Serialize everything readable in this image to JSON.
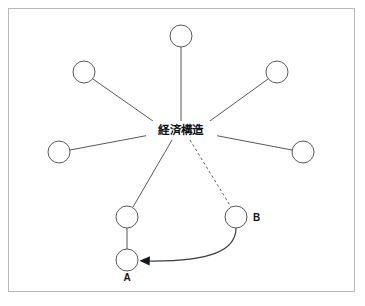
{
  "diagram": {
    "title_text": "経済構造",
    "frame": {
      "border_color": "#b9b9b9",
      "background": "#ffffff"
    },
    "colors": {
      "node_stroke": "#555a5f",
      "node_fill": "#ffffff",
      "edge": "#55595e",
      "arrow": "#17191c",
      "text": "#101316"
    },
    "center": {
      "x": 181,
      "y": 130,
      "label": "経済構造"
    },
    "nodes": [
      {
        "id": "n-top",
        "label": "",
        "cx": 181,
        "cy": 36,
        "r": 11
      },
      {
        "id": "n-upper-left",
        "label": "",
        "cx": 84,
        "cy": 72,
        "r": 11
      },
      {
        "id": "n-upper-right",
        "label": "",
        "cx": 277,
        "cy": 72,
        "r": 11
      },
      {
        "id": "n-left",
        "label": "",
        "cx": 59,
        "cy": 152,
        "r": 11
      },
      {
        "id": "n-right",
        "label": "",
        "cx": 303,
        "cy": 152,
        "r": 11
      },
      {
        "id": "n-mid-lower",
        "label": "",
        "cx": 127,
        "cy": 217,
        "r": 11
      },
      {
        "id": "n-a",
        "label": "A",
        "cx": 127,
        "cy": 260,
        "r": 11
      },
      {
        "id": "n-b",
        "label": "B",
        "cx": 236,
        "cy": 217,
        "r": 11
      }
    ],
    "labels": [
      {
        "id": "label-a",
        "text": "A",
        "x": 127,
        "y": 281
      },
      {
        "id": "label-b",
        "text": "B",
        "x": 253,
        "y": 221
      }
    ],
    "edges": [
      {
        "id": "edge-center-top",
        "from": "center",
        "to": "n-top",
        "style": "solid"
      },
      {
        "id": "edge-center-upper-left",
        "from": "center",
        "to": "n-upper-left",
        "style": "solid"
      },
      {
        "id": "edge-center-upper-right",
        "from": "center",
        "to": "n-upper-right",
        "style": "solid"
      },
      {
        "id": "edge-center-left",
        "from": "center",
        "to": "n-left",
        "style": "solid"
      },
      {
        "id": "edge-center-right",
        "from": "center",
        "to": "n-right",
        "style": "solid"
      },
      {
        "id": "edge-center-mid-lower",
        "from": "center",
        "to": "n-mid-lower",
        "style": "solid"
      },
      {
        "id": "edge-center-b",
        "from": "center",
        "to": "n-b",
        "style": "dashed"
      },
      {
        "id": "edge-mid-lower-a",
        "from": "n-mid-lower",
        "to": "n-a",
        "style": "solid"
      },
      {
        "id": "edge-b-to-a",
        "from": "n-b",
        "to": "n-a",
        "style": "curved-arrow"
      }
    ]
  }
}
